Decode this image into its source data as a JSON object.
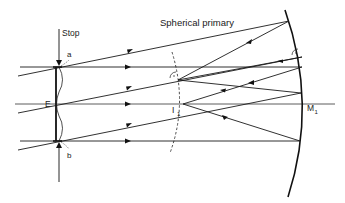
{
  "figure": {
    "title": "Spherical primary",
    "labels": {
      "stop": "Stop",
      "a": "a",
      "b": "b",
      "entrance": "E",
      "image_point_main": "I",
      "image_point_sub": "1",
      "mirror_main": "M",
      "mirror_sub": "1",
      "primary": "Spherical primary"
    },
    "components": [
      {
        "name": "stop",
        "description": "Aperture stop with corrector plate E at the center of curvature"
      },
      {
        "name": "spherical-primary",
        "description": "Spherical primary mirror M1"
      },
      {
        "name": "focal-surface",
        "description": "Curved focal surface (dashed) passing through I1"
      },
      {
        "name": "optical-axis",
        "description": "Horizontal optical axis"
      }
    ],
    "colors": {
      "line": "#1a1a1a",
      "background": "#ffffff"
    }
  }
}
